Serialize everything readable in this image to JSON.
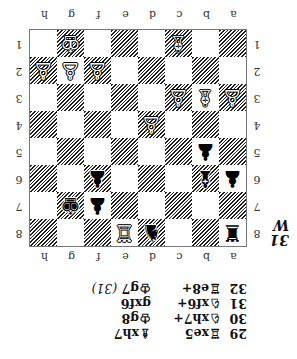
{
  "diagram": {
    "number": "31",
    "side_to_move": "W",
    "files": [
      "a",
      "b",
      "c",
      "d",
      "e",
      "f",
      "g",
      "h"
    ],
    "ranks": [
      "8",
      "7",
      "6",
      "5",
      "4",
      "3",
      "2",
      "1"
    ],
    "board": [
      [
        "bR",
        "",
        "",
        "bN",
        "wR",
        "",
        "",
        ""
      ],
      [
        "",
        "",
        "",
        "",
        "",
        "bP",
        "bK",
        ""
      ],
      [
        "bP",
        "bB",
        "",
        "",
        "",
        "bP",
        "",
        ""
      ],
      [
        "",
        "bP",
        "",
        "",
        "",
        "",
        "",
        ""
      ],
      [
        "",
        "",
        "",
        "wP",
        "",
        "",
        "",
        ""
      ],
      [
        "wP",
        "wB",
        "wP",
        "",
        "",
        "",
        "",
        ""
      ],
      [
        "",
        "",
        "",
        "",
        "",
        "wP",
        "wP",
        "wP"
      ],
      [
        "",
        "",
        "wB",
        "",
        "",
        "",
        "wK",
        ""
      ]
    ],
    "piece_glyphs": {
      "wK": "♔",
      "wQ": "♕",
      "wR": "♖",
      "wB": "♗",
      "wN": "♘",
      "wP": "♙",
      "bK": "♚",
      "bQ": "♛",
      "bR": "♜",
      "bB": "♝",
      "bN": "♞",
      "bP": "♟"
    }
  },
  "moves": [
    {
      "num": "29",
      "white": "♖xe5",
      "black": "♗xh7",
      "note": ""
    },
    {
      "num": "30",
      "white": "♘xh7+",
      "black": "♔g8",
      "note": ""
    },
    {
      "num": "31",
      "white": "♘xf6+",
      "black": "gxf6",
      "note": ""
    },
    {
      "num": "32",
      "white": "♖e8+",
      "black": "♔g7",
      "note": "(31)"
    }
  ],
  "orientation": "rotated 180°"
}
